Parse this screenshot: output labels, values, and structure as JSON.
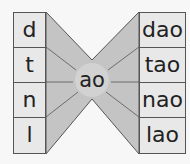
{
  "diagram": {
    "left_items": [
      "d",
      "t",
      "n",
      "l"
    ],
    "center": "ao",
    "right_items": [
      "dao",
      "tao",
      "nao",
      "lao"
    ],
    "colors": {
      "background": "#f7f7f7",
      "shape_fill": "#c4c4c4",
      "center_highlight": "#d6d6d6",
      "cell_fill": "#e8e8e8",
      "border": "#555555",
      "text": "#222222"
    }
  }
}
